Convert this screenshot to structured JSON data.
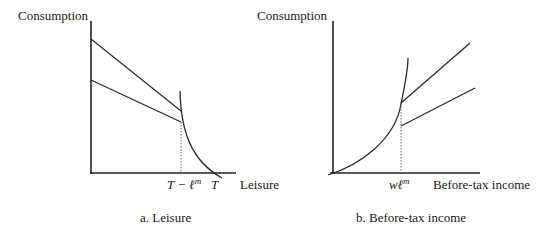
{
  "panel_a": {
    "y_label": "Consumption",
    "x_label": "Leisure",
    "tick_t_minus_lm": {
      "base": "T − ℓ",
      "sup": "m"
    },
    "tick_t": "T",
    "caption": "a. Leisure"
  },
  "panel_b": {
    "y_label": "Consumption",
    "x_label": "Before-tax income",
    "tick_wlm": {
      "base": "wℓ",
      "sup": "m"
    },
    "caption": "b. Before-tax income"
  },
  "colors": {
    "line": "#2a2a2a",
    "axis": "#222222",
    "text": "#1a1a1a"
  }
}
